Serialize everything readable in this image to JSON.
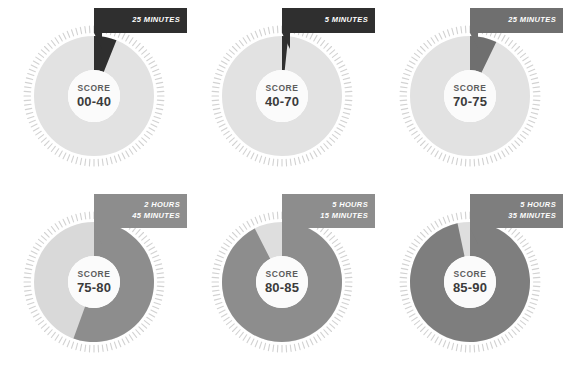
{
  "figure": {
    "type": "donut-gauge-grid",
    "columns": 3,
    "rows": 2,
    "score_word": "SCORE"
  },
  "colors": {
    "background": "#ffffff",
    "track": "#e2e2e2",
    "track_dots": "#d2d2d2",
    "center_hole": "#fbfbfb",
    "wedge_black": "#2f2f2f",
    "wedge_dark_gray": "#6f6f6f",
    "wedge_mid_gray": "#8d8d8d",
    "callout_black": "#2f2f2f",
    "callout_gray": "#7e7e7e",
    "score_word_text": "#5d5d5d",
    "score_value_text": "#3b3b3b",
    "callout_text": "#ffffff"
  },
  "chart_data": {
    "type": "pie",
    "title": "",
    "xlabel": "",
    "ylabel": "",
    "legend": "none",
    "grid": false,
    "note": "Six donut gauges; each wedge sweeps clockwise from 12 o'clock and encodes an elapsed-time value for a score band.",
    "gauges": [
      {
        "score_word": "SCORE",
        "score_range": "00-40",
        "time_lines": [
          "25 MINUTES"
        ],
        "time_value_minutes": 25,
        "wedge_degrees": 22,
        "wedge_color": "#2f2f2f",
        "callout_color": "#2f2f2f",
        "track_color": "#e2e2e2"
      },
      {
        "score_word": "SCORE",
        "score_range": "40-70",
        "time_lines": [
          "5 MINUTES"
        ],
        "time_value_minutes": 5,
        "wedge_degrees": 6,
        "wedge_color": "#2f2f2f",
        "callout_color": "#2f2f2f",
        "track_color": "#e2e2e2"
      },
      {
        "score_word": "SCORE",
        "score_range": "70-75",
        "time_lines": [
          "25 MINUTES"
        ],
        "time_value_minutes": 25,
        "wedge_degrees": 26,
        "wedge_color": "#6f6f6f",
        "callout_color": "#6f6f6f",
        "track_color": "#e2e2e2"
      },
      {
        "score_word": "SCORE",
        "score_range": "75-80",
        "time_lines": [
          "2 HOURS",
          "45 MINUTES"
        ],
        "time_value_minutes": 165,
        "wedge_degrees": 200,
        "wedge_color": "#8d8d8d",
        "callout_color": "#8d8d8d",
        "track_color": "#d9d9d9"
      },
      {
        "score_word": "SCORE",
        "score_range": "80-85",
        "time_lines": [
          "5 HOURS",
          "15 MINUTES"
        ],
        "time_value_minutes": 315,
        "wedge_degrees": 333,
        "wedge_color": "#8d8d8d",
        "callout_color": "#8d8d8d",
        "track_color": "#dedede"
      },
      {
        "score_word": "SCORE",
        "score_range": "85-90",
        "time_lines": [
          "5 HOURS",
          "35 MINUTES"
        ],
        "time_value_minutes": 335,
        "wedge_degrees": 348,
        "wedge_color": "#7e7e7e",
        "callout_color": "#7e7e7e",
        "track_color": "#dedede"
      }
    ]
  }
}
